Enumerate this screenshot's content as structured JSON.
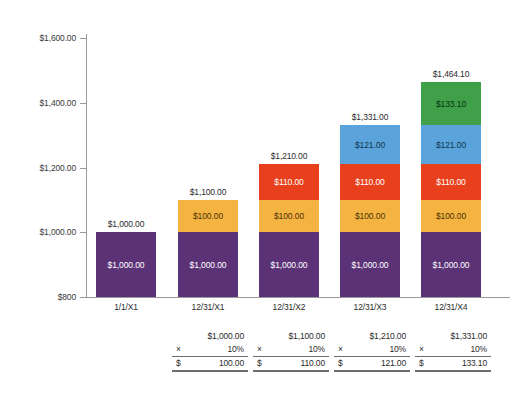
{
  "chart_data": {
    "type": "bar",
    "subtype": "stacked",
    "title": "",
    "xlabel": "",
    "ylabel": "",
    "ylim": [
      800,
      1600
    ],
    "yticks": [
      "$800",
      "$1,000.00",
      "$1,200.00",
      "$1,400.00",
      "$1,600.00"
    ],
    "ytick_values": [
      800,
      1000,
      1200,
      1400,
      1600
    ],
    "grid": false,
    "legend": "none",
    "categories": [
      "1/1/X1",
      "12/31/X1",
      "12/31/X2",
      "12/31/X3",
      "12/31/X4"
    ],
    "series": [
      {
        "name": "Principal",
        "color": "#5c3277",
        "values": [
          1000,
          1000,
          1000,
          1000,
          1000
        ],
        "labels": [
          "$1,000.00",
          "$1,000.00",
          "$1,000.00",
          "$1,000.00",
          "$1,000.00"
        ]
      },
      {
        "name": "Year 1 interest",
        "color": "#f5b342",
        "values": [
          null,
          100,
          100,
          100,
          100
        ],
        "labels": [
          null,
          "$100.00",
          "$100.00",
          "$100.00",
          "$100.00"
        ]
      },
      {
        "name": "Year 2 interest",
        "color": "#e8401c",
        "values": [
          null,
          null,
          110,
          110,
          110
        ],
        "labels": [
          null,
          null,
          "$110.00",
          "$110.00",
          "$110.00"
        ]
      },
      {
        "name": "Year 3 interest",
        "color": "#5ba4db",
        "values": [
          null,
          null,
          null,
          121,
          121
        ],
        "labels": [
          null,
          null,
          null,
          "$121.00",
          "$121.00"
        ]
      },
      {
        "name": "Year 4 interest",
        "color": "#40a04a",
        "values": [
          null,
          null,
          null,
          null,
          133.1
        ],
        "labels": [
          null,
          null,
          null,
          null,
          "$133.10"
        ]
      }
    ],
    "totals": [
      1000,
      1100,
      1210,
      1331,
      1464.1
    ],
    "total_labels": [
      "$1,000.00",
      "$1,100.00",
      "$1,210.00",
      "$1,331.00",
      "$1,464.10"
    ]
  },
  "calculations": [
    {
      "base": "$1,000.00",
      "operator": "×",
      "rate": "10%",
      "currency": "$",
      "result": "100.00"
    },
    {
      "base": "$1,100.00",
      "operator": "×",
      "rate": "10%",
      "currency": "$",
      "result": "110.00"
    },
    {
      "base": "$1,210.00",
      "operator": "×",
      "rate": "10%",
      "currency": "$",
      "result": "121.00"
    },
    {
      "base": "$1,331.00",
      "operator": "×",
      "rate": "10%",
      "currency": "$",
      "result": "133.10"
    }
  ],
  "colors": {
    "principal": "#5c3277",
    "interest_y1": "#f5b342",
    "interest_y2": "#e8401c",
    "interest_y3": "#5ba4db",
    "interest_y4": "#40a04a",
    "axis": "#9a9a9a",
    "text": "#2b2b2b",
    "background": "#ffffff"
  }
}
